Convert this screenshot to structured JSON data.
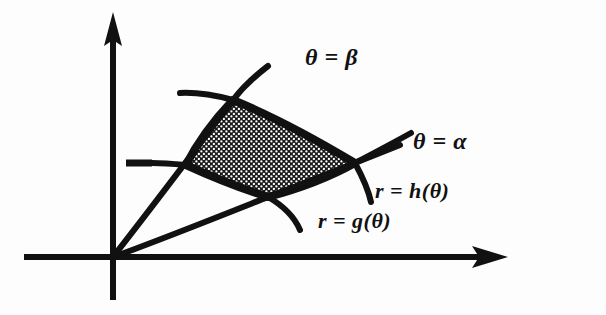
{
  "figure": {
    "background_color": "#fdfdfd",
    "ink_color": "#111111"
  },
  "axes": {
    "x_axis": {
      "name": "horizontal-axis",
      "arrow": true
    },
    "y_axis": {
      "name": "vertical-axis",
      "arrow": true
    },
    "origin": {
      "x": 113,
      "y": 257
    },
    "tick_mark": {
      "name": "radius-tick-dash",
      "x": 152,
      "y": 163,
      "length": 26
    }
  },
  "labels": {
    "theta_beta": "θ = β",
    "theta_alpha": "θ = α",
    "r_h": "r = h(θ)",
    "r_g": "r = g(θ)"
  },
  "region": {
    "name": "shaded-polar-region",
    "fill": "stipple",
    "fill_color": "#1a1a1a",
    "border_color": "#111111",
    "vertices": [
      {
        "label": "inner-beta-corner",
        "x": 233,
        "y": 100
      },
      {
        "label": "outer-beta-corner",
        "x": 355,
        "y": 163
      },
      {
        "label": "outer-alpha-corner",
        "x": 268,
        "y": 197
      },
      {
        "label": "inner-alpha-corner",
        "x": 186,
        "y": 165
      }
    ]
  },
  "curves": [
    {
      "name": "ray-theta-beta",
      "kind": "ray",
      "label": "θ = β"
    },
    {
      "name": "ray-theta-alpha",
      "kind": "ray",
      "label": "θ = α"
    },
    {
      "name": "curve-r-h",
      "kind": "outer-boundary",
      "label": "r = h(θ)"
    },
    {
      "name": "curve-r-g",
      "kind": "inner-boundary",
      "label": "r = g(θ)"
    }
  ]
}
